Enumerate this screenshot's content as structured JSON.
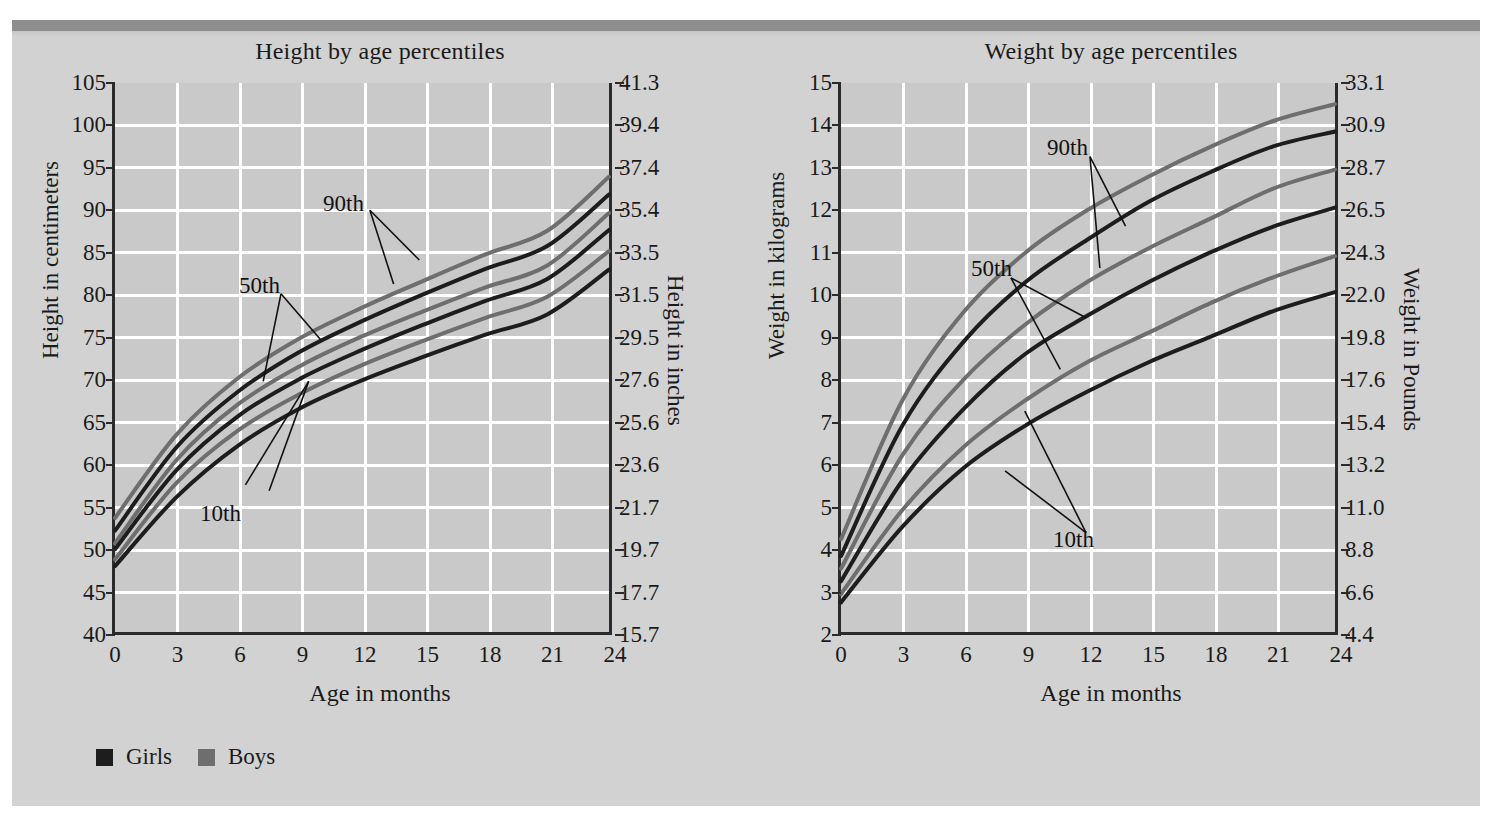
{
  "figure": {
    "background_color": "#d2d2d2",
    "plot_background_color": "#c9c9c9",
    "grid_color": "#ffffff",
    "axis_color": "#2b2b2b",
    "girls_color": "#1d1d1d",
    "boys_color": "#6e6e6e"
  },
  "legend": {
    "items": [
      {
        "label": "Girls",
        "color": "#1d1d1d",
        "swatch": "filled-square"
      },
      {
        "label": "Boys",
        "color": "#6e6e6e",
        "swatch": "filled-square"
      }
    ]
  },
  "chart_data": [
    {
      "id": "height",
      "type": "line",
      "title": "Height by age percentiles",
      "xlabel": "Age in months",
      "ylabel": "Height in centimeters",
      "y2label": "Height in inches",
      "xlim": [
        0,
        24
      ],
      "ylim": [
        40,
        105
      ],
      "grid": true,
      "legend_position": "below-figure",
      "x": [
        0,
        3,
        6,
        9,
        12,
        15,
        18,
        21,
        24
      ],
      "xticks": [
        "0",
        "3",
        "6",
        "9",
        "12",
        "15",
        "18",
        "21",
        "24"
      ],
      "yticks": [
        "105",
        "100",
        "95",
        "90",
        "85",
        "80",
        "75",
        "70",
        "65",
        "60",
        "55",
        "50",
        "45",
        "40"
      ],
      "y2ticks": [
        "41.3",
        "39.4",
        "37.4",
        "35.4",
        "33.5",
        "31.5",
        "29.5",
        "27.6",
        "25.6",
        "23.6",
        "21.7",
        "19.7",
        "17.7",
        "15.7"
      ],
      "annotations": [
        "90th",
        "50th",
        "10th"
      ],
      "series": [
        {
          "name": "Boys 90th",
          "group": "Boys",
          "percentile": "90th",
          "color": "#6e6e6e",
          "values": [
            53.5,
            63.4,
            70.1,
            74.8,
            78.4,
            81.6,
            84.7,
            87.5,
            93.9
          ]
        },
        {
          "name": "Girls 90th",
          "group": "Girls",
          "percentile": "90th",
          "color": "#1d1d1d",
          "values": [
            52.0,
            61.9,
            68.5,
            73.2,
            76.8,
            80.0,
            83.0,
            85.7,
            91.8
          ]
        },
        {
          "name": "Boys 50th",
          "group": "Boys",
          "percentile": "50th",
          "color": "#6e6e6e",
          "values": [
            50.5,
            60.4,
            67.0,
            71.5,
            75.0,
            78.0,
            80.8,
            83.4,
            89.6
          ]
        },
        {
          "name": "Girls 50th",
          "group": "Girls",
          "percentile": "50th",
          "color": "#1d1d1d",
          "values": [
            49.8,
            59.2,
            65.6,
            70.0,
            73.4,
            76.4,
            79.2,
            81.8,
            87.6
          ]
        },
        {
          "name": "Boys 10th",
          "group": "Boys",
          "percentile": "10th",
          "color": "#6e6e6e",
          "values": [
            48.6,
            57.7,
            63.9,
            68.2,
            71.6,
            74.5,
            77.2,
            79.7,
            85.1
          ]
        },
        {
          "name": "Girls 10th",
          "group": "Girls",
          "percentile": "10th",
          "color": "#1d1d1d",
          "values": [
            47.8,
            56.0,
            62.1,
            66.5,
            69.8,
            72.6,
            75.2,
            77.6,
            82.9
          ]
        }
      ]
    },
    {
      "id": "weight",
      "type": "line",
      "title": "Weight by age percentiles",
      "xlabel": "Age in months",
      "ylabel": "Weight in kilograms",
      "y2label": "Weight in Pounds",
      "xlim": [
        0,
        24
      ],
      "ylim": [
        2,
        15
      ],
      "grid": true,
      "legend_position": "below-figure",
      "x": [
        0,
        3,
        6,
        9,
        12,
        15,
        18,
        21,
        24
      ],
      "xticks": [
        "0",
        "3",
        "6",
        "9",
        "12",
        "15",
        "18",
        "21",
        "24"
      ],
      "yticks": [
        "15",
        "14",
        "13",
        "12",
        "11",
        "10",
        "9",
        "8",
        "7",
        "6",
        "5",
        "4",
        "3",
        "2"
      ],
      "y2ticks": [
        "33.1",
        "30.9",
        "28.7",
        "26.5",
        "24.3",
        "22.0",
        "19.8",
        "17.6",
        "15.4",
        "13.2",
        "11.0",
        "8.8",
        "6.6",
        "4.4"
      ],
      "annotations": [
        "90th",
        "50th",
        "10th"
      ],
      "series": [
        {
          "name": "Boys 90th",
          "group": "Boys",
          "percentile": "90th",
          "color": "#6e6e6e",
          "values": [
            4.2,
            7.5,
            9.6,
            11.0,
            12.0,
            12.8,
            13.5,
            14.1,
            14.5
          ]
        },
        {
          "name": "Girls 90th",
          "group": "Girls",
          "percentile": "90th",
          "color": "#1d1d1d",
          "values": [
            3.8,
            6.9,
            8.9,
            10.3,
            11.3,
            12.2,
            12.9,
            13.5,
            13.85
          ]
        },
        {
          "name": "Boys 50th",
          "group": "Boys",
          "percentile": "50th",
          "color": "#6e6e6e",
          "values": [
            3.5,
            6.2,
            8.0,
            9.3,
            10.3,
            11.1,
            11.8,
            12.5,
            12.95
          ]
        },
        {
          "name": "Girls 50th",
          "group": "Girls",
          "percentile": "50th",
          "color": "#1d1d1d",
          "values": [
            3.2,
            5.6,
            7.3,
            8.6,
            9.5,
            10.3,
            11.0,
            11.6,
            12.05
          ]
        },
        {
          "name": "Boys 10th",
          "group": "Boys",
          "percentile": "10th",
          "color": "#6e6e6e",
          "values": [
            2.9,
            4.9,
            6.4,
            7.5,
            8.4,
            9.1,
            9.8,
            10.4,
            10.9
          ]
        },
        {
          "name": "Girls 10th",
          "group": "Girls",
          "percentile": "10th",
          "color": "#1d1d1d",
          "values": [
            2.7,
            4.5,
            5.9,
            6.9,
            7.7,
            8.4,
            9.0,
            9.6,
            10.05
          ]
        }
      ]
    }
  ]
}
